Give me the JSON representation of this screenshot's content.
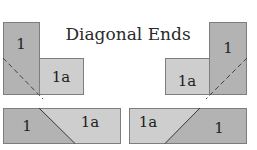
{
  "title": "Diagonal Ends",
  "colors": {
    "piece_1": "#b3b3b3",
    "piece_1a": "#cecece",
    "border": "#7d7d7d",
    "diagonal": "#444444"
  },
  "diagrams": {
    "top_left": {
      "label_1": "1",
      "label_1a": "1a",
      "line": "dashed"
    },
    "top_right": {
      "label_1": "1",
      "label_1a": "1a",
      "line": "dashed"
    },
    "bottom_left": {
      "label_1": "1",
      "label_1a": "1a",
      "line": "solid"
    },
    "bottom_right": {
      "label_1": "1",
      "label_1a": "1a",
      "line": "solid"
    }
  }
}
